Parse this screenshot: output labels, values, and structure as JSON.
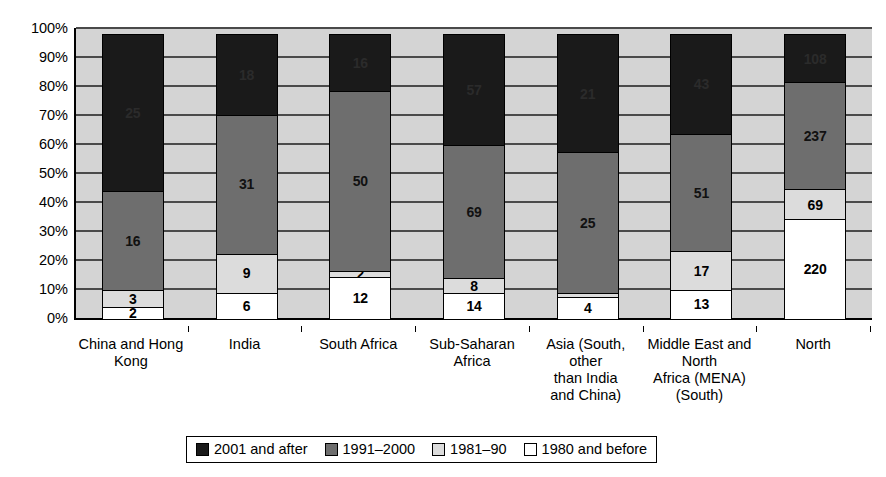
{
  "chart_data": {
    "type": "bar",
    "subtype": "stacked-100-percent",
    "title": "",
    "xlabel": "",
    "ylabel": "",
    "ylim": [
      0,
      100
    ],
    "ytick_labels": [
      "0%",
      "10%",
      "20%",
      "30%",
      "40%",
      "50%",
      "60%",
      "70%",
      "80%",
      "90%",
      "100%"
    ],
    "ytick_values": [
      0,
      10,
      20,
      30,
      40,
      50,
      60,
      70,
      80,
      90,
      100
    ],
    "grid": true,
    "legend_position": "bottom",
    "categories": [
      "China and Hong\nKong",
      "India",
      "South Africa",
      "Sub-Saharan\nAfrica",
      "Asia (South,\nother\nthan India\nand China)",
      "Middle East and\nNorth\nAfrica (MENA)\n(South)",
      "North"
    ],
    "series": [
      {
        "name": "1980 and before",
        "color": "#ffffff",
        "values": [
          2,
          6,
          12,
          14,
          4,
          13,
          220
        ],
        "labels": [
          "2",
          "6",
          "12",
          "14",
          "4",
          "13",
          "220"
        ]
      },
      {
        "name": "1981–90",
        "color": "#dcdcdc",
        "values": [
          3,
          9,
          2,
          8,
          1,
          17,
          69
        ],
        "labels": [
          "3",
          "9",
          "2",
          "8",
          "",
          "17",
          "69"
        ]
      },
      {
        "name": "1991–2000",
        "color": "#6e6e6e",
        "values": [
          16,
          31,
          50,
          69,
          25,
          51,
          237
        ],
        "labels": [
          "16",
          "31",
          "50",
          "69",
          "25",
          "51",
          "237"
        ]
      },
      {
        "name": "2001 and after",
        "color": "#1a1a1a",
        "values": [
          25,
          18,
          16,
          57,
          21,
          43,
          108
        ],
        "labels": [
          "25",
          "18",
          "16",
          "57",
          "21",
          "43",
          "108"
        ]
      }
    ]
  },
  "legend": {
    "items": [
      {
        "label": "2001 and after",
        "swatch": "c-black"
      },
      {
        "label": "1991–2000",
        "swatch": "c-dark"
      },
      {
        "label": "1981–90",
        "swatch": "c-light"
      },
      {
        "label": "1980 and before",
        "swatch": "c-white"
      }
    ]
  },
  "colors": {
    "plot_background": "#d4d4d4",
    "gridline": "#4a4a4a",
    "axis": "#000000",
    "page_background": "#ffffff"
  }
}
